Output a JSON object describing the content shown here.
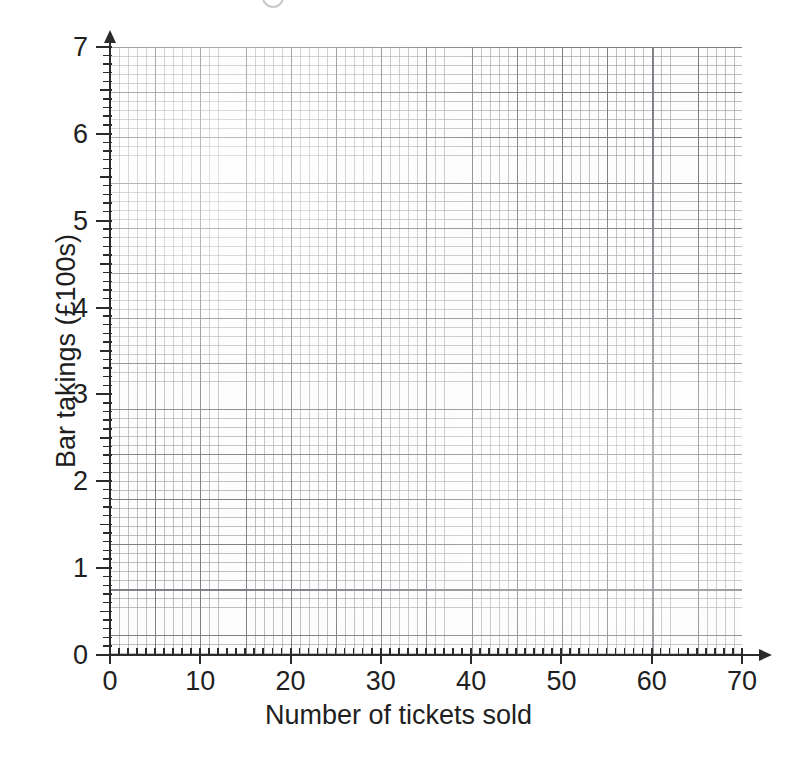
{
  "chart_data": {
    "type": "scatter",
    "title": "",
    "subtitle": "",
    "xlabel": "Number of tickets sold",
    "ylabel": "Bar takings (£100s)",
    "xlim": [
      0,
      70
    ],
    "ylim": [
      0,
      7
    ],
    "x_tick_labels": [
      "0",
      "10",
      "20",
      "30",
      "40",
      "50",
      "60",
      "70"
    ],
    "x_tick_values": [
      0,
      10,
      20,
      30,
      40,
      50,
      60,
      70
    ],
    "x_minor_tick_step": 1,
    "y_tick_labels": [
      "0",
      "1",
      "2",
      "3",
      "4",
      "5",
      "6",
      "7"
    ],
    "y_tick_values": [
      0,
      1,
      2,
      3,
      4,
      5,
      6,
      7
    ],
    "y_mid_tick_step": 0.5,
    "y_minor_tick_step": 0.1,
    "grid": true,
    "grid_style": "graph-paper",
    "grid_minor_per_major": 5,
    "legend": "none",
    "series": [],
    "values": [],
    "x": [],
    "annotations": []
  },
  "axes": {
    "x_title": "Number of tickets sold",
    "y_title": "Bar takings (£100s)",
    "x_ticks": [
      {
        "label": "0",
        "value": 0
      },
      {
        "label": "10",
        "value": 10
      },
      {
        "label": "20",
        "value": 20
      },
      {
        "label": "30",
        "value": 30
      },
      {
        "label": "40",
        "value": 40
      },
      {
        "label": "50",
        "value": 50
      },
      {
        "label": "60",
        "value": 60
      },
      {
        "label": "70",
        "value": 70
      }
    ],
    "y_ticks": [
      {
        "label": "0",
        "value": 0
      },
      {
        "label": "1",
        "value": 1
      },
      {
        "label": "2",
        "value": 2
      },
      {
        "label": "3",
        "value": 3
      },
      {
        "label": "4",
        "value": 4
      },
      {
        "label": "5",
        "value": 5
      },
      {
        "label": "6",
        "value": 6
      },
      {
        "label": "7",
        "value": 7
      }
    ]
  },
  "colors": {
    "axis": "#2b2b2b",
    "grid_major": "#787a80",
    "grid_minor": "#96989e",
    "text": "#1f1f1f",
    "paper": "#ffffff",
    "plot_background": "#fdfdfd"
  }
}
